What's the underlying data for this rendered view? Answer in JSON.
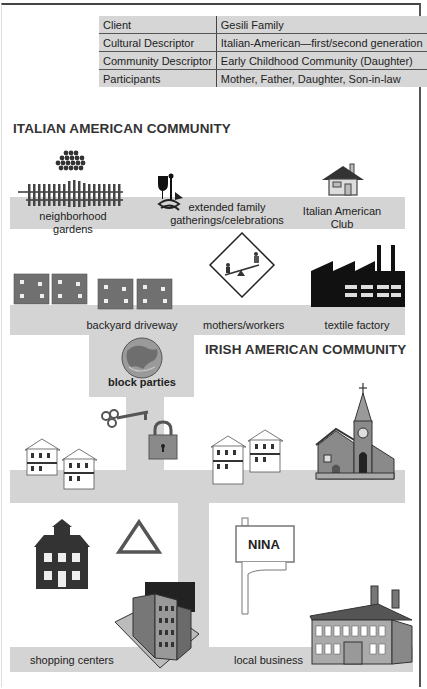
{
  "table": {
    "rows": [
      {
        "key": "Client",
        "value": "Gesili Family"
      },
      {
        "key": "Cultural Descriptor",
        "value": "Italian-American—first/second generation"
      },
      {
        "key": "Community Descriptor",
        "value": "Early Childhood Community (Daughter)"
      },
      {
        "key": "Participants",
        "value": "Mother, Father, Daughter, Son-in-law"
      }
    ]
  },
  "sections": {
    "italian": {
      "title": "ITALIAN AMERICAN COMMUNITY"
    },
    "irish": {
      "title": "IRISH AMERICAN COMMUNITY"
    }
  },
  "labels": {
    "gardens": "neighborhood gardens",
    "family_line1": "extended family",
    "family_line2": "gatherings/celebrations",
    "club_line1": "Italian American",
    "club_line2": "Club",
    "driveway": "backyard driveway",
    "mothers": "mothers/workers",
    "factory": "textile factory",
    "block_parties": "block parties",
    "shopping": "shopping centers",
    "local_business": "local business",
    "sign_text": "NINA"
  },
  "colors": {
    "road": "#d4d4d4",
    "house_red": "#6e6e6e",
    "factory": "#111111"
  }
}
